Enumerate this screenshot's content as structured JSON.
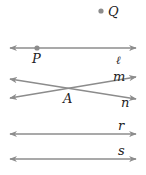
{
  "diagram": {
    "colors": {
      "line": "#8c8c8c",
      "point": "#8c8c8c",
      "label": "#222222"
    },
    "points": [
      {
        "name": "Q",
        "x": 101,
        "y": 11
      },
      {
        "name": "P",
        "x": 37,
        "y": 48
      },
      {
        "name": "A",
        "x": 70,
        "y": 88
      }
    ],
    "lines": [
      {
        "name": "ℓ",
        "x1": 10,
        "y1": 48,
        "x2": 136,
        "y2": 48
      },
      {
        "name": "m",
        "x1": 10,
        "y1": 98,
        "x2": 136,
        "y2": 77
      },
      {
        "name": "n",
        "x1": 10,
        "y1": 79,
        "x2": 136,
        "y2": 99
      },
      {
        "name": "r",
        "x1": 10,
        "y1": 134,
        "x2": 136,
        "y2": 134
      },
      {
        "name": "s",
        "x1": 10,
        "y1": 159,
        "x2": 136,
        "y2": 159
      }
    ],
    "labels": {
      "Q": "Q",
      "P": "P",
      "l": "ℓ",
      "m": "m",
      "n": "n",
      "A": "A",
      "r": "r",
      "s": "s"
    }
  }
}
